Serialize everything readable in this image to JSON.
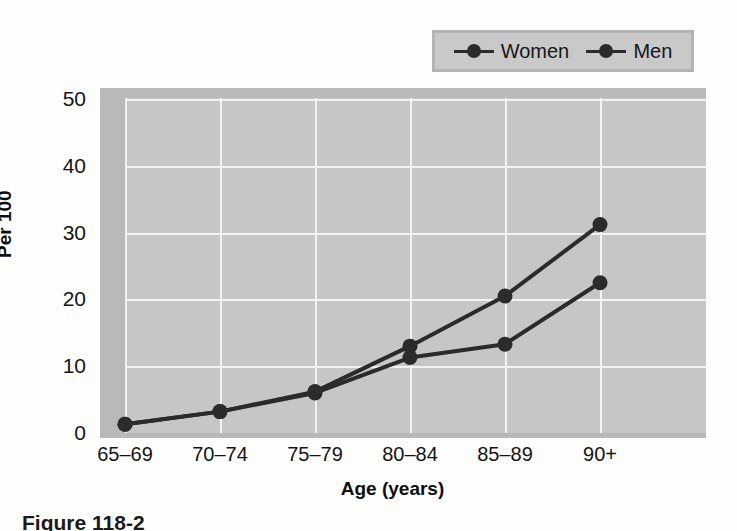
{
  "chart_data": {
    "type": "line",
    "title": "",
    "xlabel": "Age (years)",
    "ylabel": "Per 100",
    "categories": [
      "65–69",
      "70–74",
      "75–79",
      "80–84",
      "85–89",
      "90+"
    ],
    "yticks": [
      0,
      10,
      20,
      30,
      40,
      50
    ],
    "ylim": [
      0,
      50
    ],
    "grid": true,
    "legend_position": "top-right",
    "series": [
      {
        "name": "Women",
        "values": [
          1.3,
          3.2,
          6.2,
          13.0,
          20.5,
          31.2
        ]
      },
      {
        "name": "Men",
        "values": [
          1.3,
          3.2,
          6.0,
          11.3,
          13.3,
          22.5
        ]
      }
    ]
  },
  "legend": {
    "entries": [
      {
        "label": "Women",
        "marker": "circle-line-marker"
      },
      {
        "label": "Men",
        "marker": "circle-line-marker"
      }
    ]
  },
  "axes": {
    "y_label": "Per 100",
    "x_label": "Age (years)",
    "y_tick_labels": [
      "50",
      "40",
      "30",
      "20",
      "10",
      "0"
    ],
    "x_tick_labels": [
      "65–69",
      "70–74",
      "75–79",
      "80–84",
      "85–89",
      "90+"
    ]
  },
  "colors": {
    "series_line": "#2b2b2b",
    "plot_background": "#c6c6c6",
    "plot_frame": "#b9b9b9",
    "gridline": "#f2f2f2",
    "legend_background": "#c9c9c9",
    "legend_border": "#b4b4b4",
    "page_background": "#fdfdfc",
    "text": "#141414"
  },
  "caption": {
    "text": "Figure 118-2"
  },
  "background_bleed": {
    "line1": "reverse-page show-through",
    "line2": "reverse-page show-through",
    "line3": "reverse-page show-through",
    "line4": "reverse-page show-through",
    "line5": "reverse-page show-through",
    "line6": "reverse-page show-through",
    "line7": "reverse-page show-through"
  }
}
